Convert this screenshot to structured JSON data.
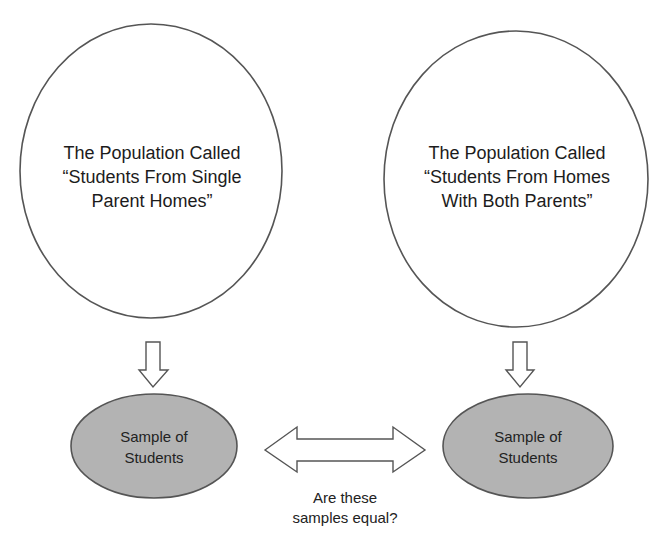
{
  "diagram": {
    "colors": {
      "background": "#ffffff",
      "stroke": "#555555",
      "population_fill": "#ffffff",
      "sample_fill": "#b3b3b3",
      "arrow_fill": "#ffffff",
      "text": "#1c1c1c"
    },
    "populations": [
      {
        "lines": [
          "The Population Called",
          "“Students From Single",
          "Parent Homes”"
        ]
      },
      {
        "lines": [
          "The Population Called",
          "“Students From Homes",
          "With Both Parents”"
        ]
      }
    ],
    "samples": [
      {
        "lines": [
          "Sample of",
          "Students"
        ]
      },
      {
        "lines": [
          "Sample of",
          "Students"
        ]
      }
    ],
    "comparison": {
      "lines": [
        "Are these",
        "samples equal?"
      ]
    },
    "icons": {
      "left_down_arrow": "down-arrow-icon",
      "right_down_arrow": "down-arrow-icon",
      "comparison_arrow": "double-headed-arrow-icon"
    }
  }
}
